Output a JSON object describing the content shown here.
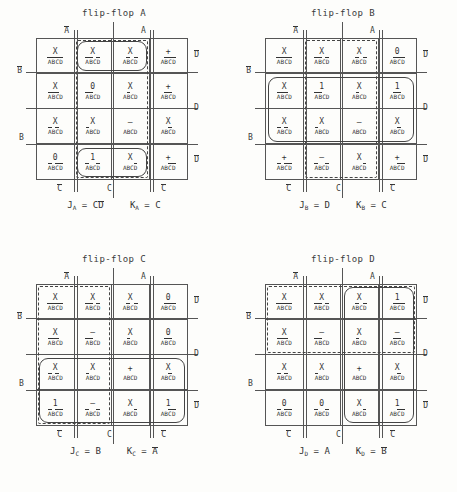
{
  "page": {
    "kind": "karnaugh-map-sheet",
    "map_count": 4,
    "grid_rows": 4,
    "grid_cols": 4
  },
  "symbols": {
    "dont_care": "X",
    "one": "1",
    "zero": "0",
    "dash": "–",
    "plus": "+"
  },
  "maps": [
    {
      "id": "A",
      "title": "flip-flop A",
      "axis": {
        "top_left": "A̅",
        "top_right": "A",
        "left_upper": "B̅",
        "left_lower": "B",
        "right_upper": "D̅",
        "right_middle": "D",
        "right_lower": "D̅",
        "bottom_left": "C̅",
        "bottom_center": "C",
        "bottom_right": "C̅"
      },
      "rows": [
        [
          {
            "value": "X",
            "minterm": "A̅B̅C̅D̅"
          },
          {
            "value": "X",
            "minterm": "A̅B̅C D̅"
          },
          {
            "value": "X",
            "minterm": "A B̅C D̅"
          },
          {
            "value": "+",
            "minterm": "A B̅C̅D̅"
          }
        ],
        [
          {
            "value": "X",
            "minterm": "A̅B̅C̅D"
          },
          {
            "value": "0",
            "minterm": "A̅B̅C D"
          },
          {
            "value": "X",
            "minterm": "A B̅C D"
          },
          {
            "value": "+",
            "minterm": "A B̅C̅D"
          }
        ],
        [
          {
            "value": "X",
            "minterm": "A̅B C̅D"
          },
          {
            "value": "X",
            "minterm": "A̅B C D"
          },
          {
            "value": "–",
            "minterm": "A B C D"
          },
          {
            "value": "X",
            "minterm": "A B C̅D"
          }
        ],
        [
          {
            "value": "0",
            "minterm": "A̅B C̅D̅"
          },
          {
            "value": "1",
            "minterm": "A̅B C D̅"
          },
          {
            "value": "X",
            "minterm": "A B C D̅"
          },
          {
            "value": "+",
            "minterm": "A B C̅D̅"
          }
        ]
      ],
      "groups": [
        {
          "style": "solid",
          "desc": "row1-cols2-3",
          "row": 0,
          "col": 1,
          "rowspan": 1,
          "colspan": 2
        },
        {
          "style": "solid",
          "desc": "row4-cols2-3",
          "row": 3,
          "col": 1,
          "rowspan": 1,
          "colspan": 2
        },
        {
          "style": "dashed",
          "desc": "cols2-3-all-rows",
          "row": 0,
          "col": 1,
          "rowspan": 4,
          "colspan": 2
        }
      ],
      "equations": {
        "j_label": "J",
        "j_sub": "A",
        "j_value": "C D̅",
        "k_label": "K",
        "k_sub": "A",
        "k_value": "C"
      }
    },
    {
      "id": "B",
      "title": "flip-flop B",
      "axis": {
        "top_left": "A̅",
        "top_right": "A",
        "left_upper": "B̅",
        "left_lower": "B",
        "right_upper": "D̅",
        "right_middle": "D",
        "right_lower": "D̅",
        "bottom_left": "C̅",
        "bottom_center": "C",
        "bottom_right": "C̅"
      },
      "rows": [
        [
          {
            "value": "X",
            "minterm": "A̅B̅C̅D̅"
          },
          {
            "value": "X",
            "minterm": "A̅B̅C D̅"
          },
          {
            "value": "X",
            "minterm": "A B̅C D̅"
          },
          {
            "value": "0",
            "minterm": "A B̅C̅D̅"
          }
        ],
        [
          {
            "value": "X",
            "minterm": "A̅B̅C̅D"
          },
          {
            "value": "1",
            "minterm": "A̅B̅C D"
          },
          {
            "value": "X",
            "minterm": "A B̅C D"
          },
          {
            "value": "1",
            "minterm": "A B̅C̅D"
          }
        ],
        [
          {
            "value": "X",
            "minterm": "A̅B C̅D"
          },
          {
            "value": "X",
            "minterm": "A̅B C D"
          },
          {
            "value": "–",
            "minterm": "A B C D"
          },
          {
            "value": "X",
            "minterm": "A B C̅D"
          }
        ],
        [
          {
            "value": "+",
            "minterm": "A̅B C̅D̅"
          },
          {
            "value": "–",
            "minterm": "A̅B C D̅"
          },
          {
            "value": "X",
            "minterm": "A B C D̅"
          },
          {
            "value": "+",
            "minterm": "A B C̅D̅"
          }
        ]
      ],
      "groups": [
        {
          "style": "solid",
          "desc": "rows2-3-all-cols",
          "row": 1,
          "col": 0,
          "rowspan": 2,
          "colspan": 4
        },
        {
          "style": "dashed",
          "desc": "cols2-3-all-rows",
          "row": 0,
          "col": 1,
          "rowspan": 4,
          "colspan": 2
        }
      ],
      "equations": {
        "j_label": "J",
        "j_sub": "B",
        "j_value": "D",
        "k_label": "K",
        "k_sub": "B",
        "k_value": "C"
      }
    },
    {
      "id": "C",
      "title": "flip-flop C",
      "axis": {
        "top_left": "A̅",
        "top_right": "A",
        "left_upper": "B̅",
        "left_lower": "B",
        "right_upper": "D̅",
        "right_middle": "D",
        "right_lower": "D̅",
        "bottom_left": "C̅",
        "bottom_center": "C",
        "bottom_right": "C̅"
      },
      "rows": [
        [
          {
            "value": "X",
            "minterm": "A̅B̅C̅D̅"
          },
          {
            "value": "X",
            "minterm": "A̅B̅C D̅"
          },
          {
            "value": "X",
            "minterm": "A B̅C D̅"
          },
          {
            "value": "0",
            "minterm": "A B̅C̅D̅"
          }
        ],
        [
          {
            "value": "X",
            "minterm": "A̅B̅C̅D"
          },
          {
            "value": "–",
            "minterm": "A̅B̅C D"
          },
          {
            "value": "X",
            "minterm": "A B̅C D"
          },
          {
            "value": "0",
            "minterm": "A B̅C̅D"
          }
        ],
        [
          {
            "value": "X",
            "minterm": "A̅B C̅D"
          },
          {
            "value": "X",
            "minterm": "A̅B C D"
          },
          {
            "value": "+",
            "minterm": "A B C D"
          },
          {
            "value": "X",
            "minterm": "A B C̅D"
          }
        ],
        [
          {
            "value": "1",
            "minterm": "A̅B C̅D̅"
          },
          {
            "value": "–",
            "minterm": "A̅B C D̅"
          },
          {
            "value": "X",
            "minterm": "A B C D̅"
          },
          {
            "value": "1",
            "minterm": "A B C̅D̅"
          }
        ]
      ],
      "groups": [
        {
          "style": "dashed",
          "desc": "cols1-2-all-rows",
          "row": 0,
          "col": 0,
          "rowspan": 4,
          "colspan": 2
        },
        {
          "style": "solid",
          "desc": "rows3-4-all-cols",
          "row": 2,
          "col": 0,
          "rowspan": 2,
          "colspan": 4
        }
      ],
      "equations": {
        "j_label": "J",
        "j_sub": "C",
        "j_value": "B",
        "k_label": "K",
        "k_sub": "C",
        "k_value": "A̅"
      }
    },
    {
      "id": "D",
      "title": "flip-flop D",
      "axis": {
        "top_left": "A̅",
        "top_right": "A",
        "left_upper": "B̅",
        "left_lower": "B",
        "right_upper": "D̅",
        "right_middle": "D",
        "right_lower": "D̅",
        "bottom_left": "C̅",
        "bottom_center": "C",
        "bottom_right": "C̅"
      },
      "rows": [
        [
          {
            "value": "X",
            "minterm": "A̅B̅C̅D̅"
          },
          {
            "value": "X",
            "minterm": "A̅B̅C D̅"
          },
          {
            "value": "X",
            "minterm": "A B̅C D̅"
          },
          {
            "value": "1",
            "minterm": "A B̅C̅D̅"
          }
        ],
        [
          {
            "value": "X",
            "minterm": "A̅B̅C̅D"
          },
          {
            "value": "–",
            "minterm": "A̅B̅C D"
          },
          {
            "value": "X",
            "minterm": "A B̅C D"
          },
          {
            "value": "–",
            "minterm": "A B̅C̅D"
          }
        ],
        [
          {
            "value": "X",
            "minterm": "A̅B C̅D"
          },
          {
            "value": "X",
            "minterm": "A̅B C D"
          },
          {
            "value": "+",
            "minterm": "A B C D"
          },
          {
            "value": "X",
            "minterm": "A B C̅D"
          }
        ],
        [
          {
            "value": "0",
            "minterm": "A̅B C̅D̅"
          },
          {
            "value": "0",
            "minterm": "A̅B C D̅"
          },
          {
            "value": "X",
            "minterm": "A B C D̅"
          },
          {
            "value": "1",
            "minterm": "A B C̅D̅"
          }
        ]
      ],
      "groups": [
        {
          "style": "dashed",
          "desc": "rows1-2-all-cols",
          "row": 0,
          "col": 0,
          "rowspan": 2,
          "colspan": 4
        },
        {
          "style": "solid",
          "desc": "cols3-4-all-rows",
          "row": 0,
          "col": 2,
          "rowspan": 4,
          "colspan": 2
        }
      ],
      "equations": {
        "j_label": "J",
        "j_sub": "D",
        "j_value": "A",
        "k_label": "K",
        "k_sub": "D",
        "k_value": "B̅"
      }
    }
  ]
}
